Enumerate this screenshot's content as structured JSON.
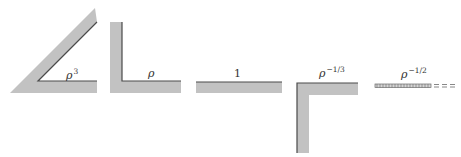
{
  "diagram": {
    "colors": {
      "band_fill": "#c2c2c2",
      "edge_line": "#4a4a4a",
      "background": "#ffffff"
    },
    "shapes": [
      {
        "id": "wedge",
        "description": "acute wedge (sharp angle)",
        "label_base": "ρ",
        "label_exp": "3"
      },
      {
        "id": "right-angle",
        "description": "right-angle corner (L-shape)",
        "label_base": "ρ",
        "label_exp": ""
      },
      {
        "id": "flat",
        "description": "flat surface (straight edge)",
        "label_base": "1",
        "label_exp": ""
      },
      {
        "id": "reentrant-corner",
        "description": "re-entrant corner (inverted L)",
        "label_base": "ρ",
        "label_exp": "−1/3"
      },
      {
        "id": "crack",
        "description": "thin crack / slit (hatched line with dashed extension)",
        "label_base": "ρ",
        "label_exp": "−1/2"
      }
    ]
  }
}
